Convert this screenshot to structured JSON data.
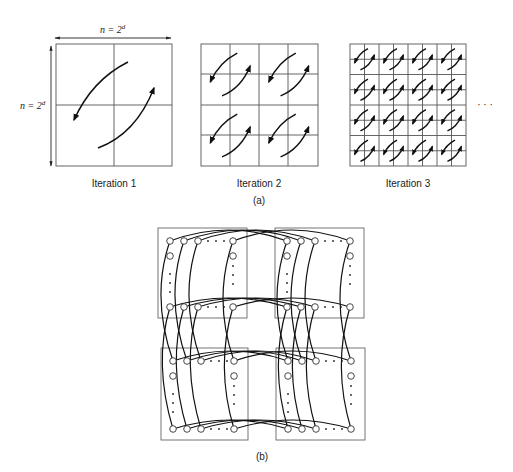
{
  "part_a": {
    "dimension_label_top": "n = 2^d",
    "dimension_label_left": "n = 2^d",
    "iterations": [
      {
        "label": "Iteration 1",
        "grid": 2
      },
      {
        "label": "Iteration 2",
        "grid": 4
      },
      {
        "label": "Iteration 3",
        "grid": 8
      }
    ],
    "continuation": "· · ·",
    "caption": "(a)"
  },
  "part_b": {
    "caption": "(b)",
    "subcubes": 4,
    "nodes_per_row_visible": 5
  },
  "labels": {
    "n_text": "n = 2",
    "d_sup": "d",
    "iter1": "Iteration 1",
    "iter2": "Iteration 2",
    "iter3": "Iteration 3",
    "cap_a": "(a)",
    "cap_b": "(b)",
    "ellipsis": "· · ·"
  }
}
